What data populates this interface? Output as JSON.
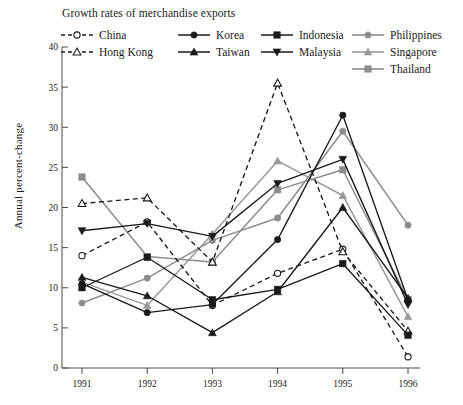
{
  "chart_data": {
    "type": "line",
    "title": "Growth rates of merchandise exports",
    "xlabel": "",
    "ylabel": "Annual percent-change",
    "categories": [
      "1991",
      "1992",
      "1993",
      "1994",
      "1995",
      "1996"
    ],
    "x": [
      1991,
      1992,
      1993,
      1994,
      1995,
      1996
    ],
    "xlim": [
      1990.75,
      1996.4
    ],
    "ylim": [
      0,
      40
    ],
    "yticks": [
      0,
      5,
      10,
      15,
      20,
      25,
      30,
      35,
      40
    ],
    "xticks": [
      "1991",
      "1992",
      "1993",
      "1994",
      "1995",
      "1996"
    ],
    "grid": false,
    "legend_position": "top",
    "series": [
      {
        "name": "China",
        "values": [
          14.0,
          18.2,
          7.8,
          11.8,
          14.8,
          1.4
        ],
        "color": "#1a1a1a",
        "marker": "open-circle",
        "dash": "dashed"
      },
      {
        "name": "Hong Kong",
        "values": [
          20.5,
          21.2,
          13.2,
          35.5,
          14.5,
          4.6
        ],
        "color": "#1a1a1a",
        "marker": "open-triangle",
        "dash": "dashed"
      },
      {
        "name": "Korea",
        "values": [
          10.5,
          6.9,
          7.9,
          16.0,
          31.5,
          8.5
        ],
        "color": "#1a1a1a",
        "marker": "filled-circle",
        "dash": "solid"
      },
      {
        "name": "Taiwan",
        "values": [
          11.3,
          9.0,
          4.4,
          9.5,
          20.0,
          8.7
        ],
        "color": "#1a1a1a",
        "marker": "filled-triangle",
        "dash": "solid"
      },
      {
        "name": "Indonesia",
        "values": [
          10.0,
          13.8,
          8.5,
          9.8,
          13.0,
          4.1
        ],
        "color": "#1a1a1a",
        "marker": "filled-square",
        "dash": "solid"
      },
      {
        "name": "Malaysia",
        "values": [
          17.1,
          18.0,
          16.4,
          23.0,
          26.0,
          7.9
        ],
        "color": "#1a1a1a",
        "marker": "filled-down-triangle",
        "dash": "solid"
      },
      {
        "name": "Philippines",
        "values": [
          8.1,
          11.2,
          15.9,
          18.7,
          29.5,
          17.8
        ],
        "color": "#8c8c8c",
        "marker": "filled-circle",
        "dash": "solid"
      },
      {
        "name": "Singapore",
        "values": [
          10.7,
          7.8,
          16.7,
          25.8,
          21.5,
          6.4
        ],
        "color": "#9a9a9a",
        "marker": "filled-triangle",
        "dash": "solid"
      },
      {
        "name": "Thailand",
        "values": [
          23.8,
          13.9,
          13.2,
          22.2,
          24.7,
          8.5
        ],
        "color": "#8c8c8c",
        "marker": "filled-square",
        "dash": "solid"
      }
    ]
  },
  "legend": {
    "columns": [
      {
        "left": 0,
        "items": [
          "China",
          "Hong Kong"
        ]
      },
      {
        "left": 117,
        "items": [
          "Korea",
          "Taiwan"
        ]
      },
      {
        "left": 200,
        "items": [
          "Indonesia",
          "Malaysia"
        ]
      },
      {
        "left": 291,
        "items": [
          "Philippines",
          "Singapore",
          "Thailand"
        ]
      }
    ]
  }
}
